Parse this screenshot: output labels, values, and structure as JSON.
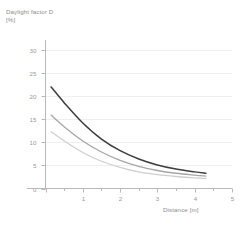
{
  "chart_data": {
    "type": "line",
    "title": "",
    "ylabel_line1": "Daylight factor D",
    "ylabel_line2": "[%]",
    "xlabel": "Distance [m]",
    "xlim": [
      0,
      5
    ],
    "ylim": [
      0,
      30
    ],
    "xticks": [
      0,
      1,
      2,
      3,
      4,
      5
    ],
    "xticklabels": [
      "",
      "1",
      "2",
      "3",
      "4",
      "5"
    ],
    "xminorticks": [
      0.5,
      1.5,
      2.5,
      3.5,
      4.5
    ],
    "yticks": [
      0,
      5,
      10,
      15,
      20,
      25,
      30
    ],
    "yticklabels": [
      "0",
      "5",
      "10",
      "15",
      "20",
      "25",
      "30"
    ],
    "grid": "horizontal-faint",
    "legend": "none",
    "x": [
      0.15,
      0.5,
      1.0,
      1.5,
      2.0,
      2.5,
      3.0,
      3.5,
      4.0,
      4.3
    ],
    "series": [
      {
        "name": "curve-dark",
        "color": "#3d3d3d",
        "width": 1.5,
        "values": [
          22.0,
          18.6,
          14.2,
          10.7,
          8.2,
          6.4,
          5.1,
          4.2,
          3.6,
          3.3
        ]
      },
      {
        "name": "curve-medium",
        "color": "#a6a6a6",
        "width": 1.3,
        "values": [
          15.9,
          13.4,
          10.3,
          7.9,
          6.1,
          4.8,
          3.9,
          3.3,
          2.9,
          2.7
        ]
      },
      {
        "name": "curve-light",
        "color": "#cfcfcf",
        "width": 1.3,
        "values": [
          12.3,
          10.3,
          7.8,
          5.9,
          4.6,
          3.6,
          3.0,
          2.6,
          2.3,
          2.2
        ]
      }
    ],
    "axis_color": "#b9b9b9",
    "grid_color": "#efefef",
    "text_color": "#9a9a9a"
  }
}
